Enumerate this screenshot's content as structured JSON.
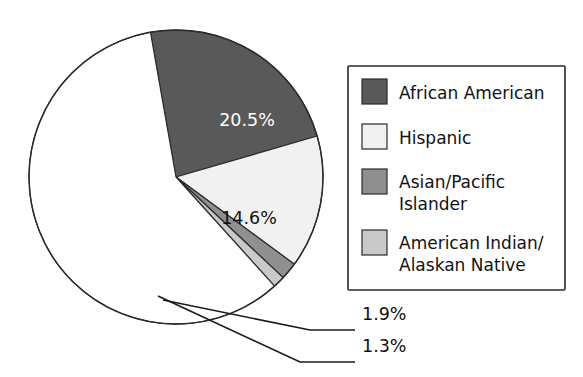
{
  "chart_data": {
    "type": "pie",
    "title": "",
    "subtitle": "",
    "xlabel": "",
    "ylabel": "",
    "legend_position": "right",
    "grid": false,
    "categories": [
      "African American",
      "Hispanic",
      "Asian/Pacific Islander",
      "American Indian/Alaskan Native",
      ""
    ],
    "values": [
      20.5,
      14.6,
      1.9,
      1.3,
      61.7
    ],
    "value_labels": [
      "20.5%",
      "14.6%",
      "1.9%",
      "1.3%",
      ""
    ],
    "colors": [
      "#595959",
      "#f1f1f1",
      "#8f8f8f",
      "#c9c9c9",
      "#ffffff"
    ],
    "slices": [
      {
        "label": "African American",
        "value": 20.5,
        "value_label": "20.5%",
        "color": "#595959",
        "label_color": "#ffffff",
        "label_placement": "inside",
        "start_angle": 350.0,
        "end_angle": 73.8
      },
      {
        "label": "Hispanic",
        "value": 14.6,
        "value_label": "14.6%",
        "color": "#f1f1f1",
        "label_color": "#111111",
        "label_placement": "inside",
        "start_angle": 73.8,
        "end_angle": 126.4
      },
      {
        "label": "Asian/Pacific Islander",
        "value": 1.9,
        "value_label": "1.9%",
        "color": "#8f8f8f",
        "label_color": "#111111",
        "label_placement": "callout",
        "start_angle": 126.4,
        "end_angle": 133.2
      },
      {
        "label": "American Indian/Alaskan Native",
        "value": 1.3,
        "value_label": "1.3%",
        "color": "#c9c9c9",
        "label_color": "#111111",
        "label_placement": "callout",
        "start_angle": 133.2,
        "end_angle": 137.9
      },
      {
        "label": "",
        "value": 61.7,
        "value_label": "",
        "color": "#ffffff",
        "label_color": "#111111",
        "label_placement": "none",
        "start_angle": 137.9,
        "end_angle": 350.0
      }
    ]
  },
  "pie": {
    "inside_labels": [
      {
        "text": "20.5%",
        "x": 247,
        "y": 126
      },
      {
        "text": "14.6%",
        "x": 249,
        "y": 224
      }
    ],
    "callouts": [
      {
        "text": "1.9%",
        "x": 371,
        "y": 320
      },
      {
        "text": "1.3%",
        "x": 371,
        "y": 352
      }
    ]
  },
  "legend": {
    "items": [
      {
        "label": "African American",
        "label_line2": "",
        "color": "#595959"
      },
      {
        "label": "Hispanic",
        "label_line2": "",
        "color": "#f1f1f1"
      },
      {
        "label": "Asian/Pacific",
        "label_line2": "Islander",
        "color": "#8f8f8f"
      },
      {
        "label": "American Indian/",
        "label_line2": "Alaskan Native",
        "color": "#c9c9c9"
      }
    ]
  },
  "colors": {
    "african_american": "#595959",
    "hispanic": "#f1f1f1",
    "asian_pacific_islander": "#8f8f8f",
    "american_indian": "#c9c9c9",
    "remainder": "#ffffff",
    "outline": "#2b2b2b",
    "text": "#111111"
  }
}
